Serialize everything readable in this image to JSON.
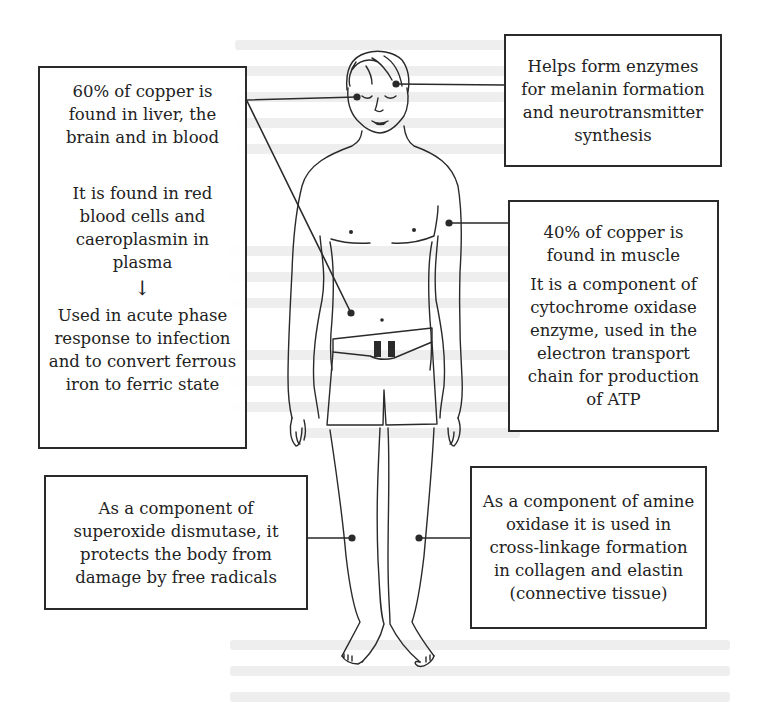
{
  "diagram": {
    "colors": {
      "line": "#2a2a2a",
      "background": "#ffffff",
      "text": "#222222"
    },
    "figure": {
      "name": "standing human male figure (front view, eyes closed, wearing shorts with belt)"
    },
    "callouts": [
      {
        "id": "liver-brain-blood",
        "position": "left-top",
        "paragraphs": [
          "60% of copper is found in liver, the brain and in blood",
          "It is found in red blood cells and caeroplasmin in plasma"
        ],
        "arrow": "↓",
        "after_arrow": "Used in acute phase response to infection and to convert ferrous iron to ferric state",
        "points_to": [
          "head (brain)",
          "abdomen (liver)"
        ]
      },
      {
        "id": "melanin-neurotransmitter",
        "position": "right-top",
        "paragraphs": [
          "Helps form enzymes for melanin formation and neurotransmitter synthesis"
        ],
        "points_to": [
          "head"
        ]
      },
      {
        "id": "muscle-cytochrome",
        "position": "right-middle",
        "paragraphs": [
          "40% of copper is found in muscle",
          "It is a component of cytochrome oxidase enzyme, used in the electron transport chain for production of ATP"
        ],
        "points_to": [
          "upper arm (muscle)"
        ]
      },
      {
        "id": "superoxide-dismutase",
        "position": "left-bottom",
        "paragraphs": [
          "As a component of superoxide dismutase, it protects the body from damage by free radicals"
        ],
        "points_to": [
          "right leg"
        ]
      },
      {
        "id": "amine-oxidase",
        "position": "right-bottom",
        "paragraphs": [
          "As a component of amine oxidase it is used in cross-linkage formation in collagen and elastin (connective tissue)"
        ],
        "points_to": [
          "left leg"
        ]
      }
    ]
  }
}
